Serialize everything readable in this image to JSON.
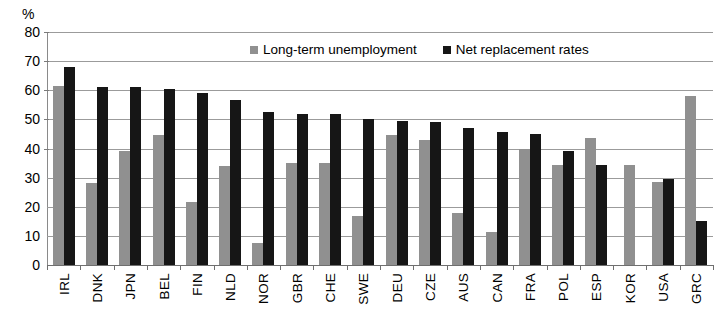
{
  "chart_data": {
    "type": "bar",
    "title": "",
    "subtitle": "",
    "xlabel": "",
    "ylabel": "%",
    "ylim": [
      0,
      80
    ],
    "yticks": [
      0,
      10,
      20,
      30,
      40,
      50,
      60,
      70,
      80
    ],
    "grid": true,
    "legend_position": "top-center",
    "categories": [
      "IRL",
      "DNK",
      "JPN",
      "BEL",
      "FIN",
      "NLD",
      "NOR",
      "GBR",
      "CHE",
      "SWE",
      "DEU",
      "CZE",
      "AUS",
      "CAN",
      "FRA",
      "POL",
      "ESP",
      "KOR",
      "USA",
      "GRC"
    ],
    "series": [
      {
        "name": "Long-term unemployment",
        "color": "#909090",
        "values": [
          61.5,
          28,
          39,
          44.5,
          21.5,
          34,
          7.5,
          35,
          35,
          17,
          44.5,
          43,
          18,
          11.5,
          40,
          34.5,
          43.5,
          34.5,
          28.5,
          58
        ]
      },
      {
        "name": "Net replacement rates",
        "color": "#161616",
        "values": [
          68,
          61,
          61,
          60.5,
          59,
          56.5,
          52.5,
          52,
          52,
          50,
          49.5,
          49,
          47,
          45.5,
          45,
          39,
          34.5,
          0,
          29.5,
          15
        ]
      }
    ]
  },
  "axis": {
    "y_unit": "%"
  },
  "legend": {
    "items": [
      {
        "label": "Long-term unemployment",
        "swatch": "gray"
      },
      {
        "label": "Net replacement rates",
        "swatch": "black"
      }
    ]
  }
}
